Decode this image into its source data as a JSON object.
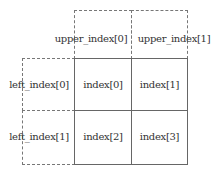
{
  "diagram": {
    "upper_labels": [
      "upper_index[0]",
      "upper_index[1]"
    ],
    "left_labels": [
      "left_index[0]",
      "left_index[1]"
    ],
    "cells": [
      "index[0]",
      "index[1]",
      "index[2]",
      "index[3]"
    ]
  }
}
